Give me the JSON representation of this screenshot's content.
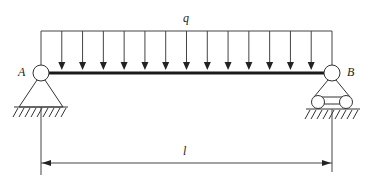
{
  "diagram": {
    "type": "simply-supported beam with uniformly distributed load",
    "load": {
      "label": "q",
      "arrow_count": 13
    },
    "support_left": {
      "label": "A",
      "type": "pin"
    },
    "support_right": {
      "label": "B",
      "type": "roller"
    },
    "span": {
      "label": "l"
    }
  },
  "colors": {
    "stroke": "#333333",
    "beam": "#1a1a1a",
    "background": "#ffffff"
  }
}
